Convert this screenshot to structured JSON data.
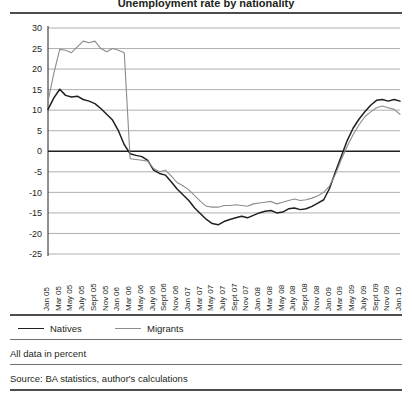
{
  "figure": {
    "title_partial": "Unemployment rate by nationality",
    "legend": [
      {
        "label": "Natives",
        "color": "#231f20",
        "style": "dark"
      },
      {
        "label": "Migrants",
        "color": "#8c8c8c",
        "style": "light"
      }
    ],
    "notes": {
      "units": "All data in percent",
      "source": "Source: BA statistics, author's calculations"
    }
  },
  "chart_data": {
    "type": "line",
    "title": "Unemployment rate by nationality",
    "xlabel": "",
    "ylabel": "",
    "ylim": [
      -25,
      30
    ],
    "ytick_step": 5,
    "yticks": [
      30,
      25,
      20,
      15,
      10,
      5,
      0,
      -5,
      -10,
      -15,
      -20,
      -25
    ],
    "ytick_labels": [
      "30",
      "25",
      "20",
      "15",
      "10",
      "5",
      "0",
      "-5",
      "-10",
      "-15",
      "-20",
      "-25"
    ],
    "grid": true,
    "zero_line": true,
    "legend_position": "below",
    "x_tick_labels": [
      "Jan 05",
      "Mar 05",
      "May 05",
      "July 05",
      "Sept 05",
      "Nov 05",
      "Jan 06",
      "Mar 06",
      "May 06",
      "July 06",
      "Sept 06",
      "Nov 06",
      "Jan 07",
      "Mar 07",
      "May 07",
      "July 07",
      "Sept 07",
      "Nov 07",
      "Jan 08",
      "Mar 08",
      "May 08",
      "July 08",
      "Sept 08",
      "Nov 08",
      "Jan 09",
      "Mar 09",
      "May 09",
      "July 09",
      "Sept 09",
      "Nov 09",
      "Jan 10"
    ],
    "x": [
      "Jan 05",
      "Feb 05",
      "Mar 05",
      "Apr 05",
      "May 05",
      "June 05",
      "July 05",
      "Aug 05",
      "Sept 05",
      "Oct 05",
      "Nov 05",
      "Dec 05",
      "Jan 06",
      "Feb 06",
      "Mar 06",
      "Apr 06",
      "May 06",
      "June 06",
      "July 06",
      "Aug 06",
      "Sept 06",
      "Oct 06",
      "Nov 06",
      "Dec 06",
      "Jan 07",
      "Feb 07",
      "Mar 07",
      "Apr 07",
      "May 07",
      "June 07",
      "July 07",
      "Aug 07",
      "Sept 07",
      "Oct 07",
      "Nov 07",
      "Dec 07",
      "Jan 08",
      "Feb 08",
      "Mar 08",
      "Apr 08",
      "May 08",
      "June 08",
      "July 08",
      "Aug 08",
      "Sept 08",
      "Oct 08",
      "Nov 08",
      "Dec 08",
      "Jan 09",
      "Feb 09",
      "Mar 09",
      "Apr 09",
      "May 09",
      "June 09",
      "July 09",
      "Aug 09",
      "Sept 09",
      "Oct 09",
      "Nov 09",
      "Dec 09",
      "Jan 10"
    ],
    "series": [
      {
        "name": "Natives",
        "color": "#231f20",
        "values": [
          10.2,
          13.0,
          15.1,
          13.6,
          13.2,
          13.4,
          12.6,
          12.2,
          11.6,
          10.4,
          9.0,
          7.6,
          5.0,
          1.6,
          -0.6,
          -1.0,
          -1.3,
          -2.2,
          -4.6,
          -5.4,
          -5.8,
          -7.4,
          -9.2,
          -10.6,
          -12.0,
          -13.8,
          -15.2,
          -16.6,
          -17.6,
          -17.9,
          -17.1,
          -16.6,
          -16.2,
          -15.8,
          -16.2,
          -15.6,
          -15.0,
          -14.6,
          -14.4,
          -15.0,
          -14.8,
          -14.0,
          -13.8,
          -14.2,
          -14.0,
          -13.4,
          -12.6,
          -11.8,
          -9.0,
          -5.0,
          -1.2,
          2.6,
          5.6,
          7.8,
          9.6,
          11.2,
          12.4,
          12.6,
          12.2,
          12.6,
          12.2
        ]
      },
      {
        "name": "Migrants",
        "color": "#8c8c8c",
        "values": [
          12.2,
          19.0,
          24.8,
          24.6,
          24.0,
          25.4,
          26.8,
          26.4,
          26.8,
          25.0,
          24.2,
          25.0,
          24.6,
          24.0,
          -1.8,
          -2.0,
          -2.2,
          -2.4,
          -4.2,
          -5.0,
          -4.6,
          -6.0,
          -7.6,
          -8.4,
          -9.4,
          -10.8,
          -12.2,
          -13.4,
          -13.6,
          -13.6,
          -13.2,
          -13.2,
          -13.0,
          -13.2,
          -13.4,
          -12.8,
          -12.6,
          -12.4,
          -12.2,
          -12.8,
          -12.4,
          -12.0,
          -11.6,
          -12.0,
          -11.8,
          -11.4,
          -10.8,
          -10.0,
          -8.4,
          -5.6,
          -2.0,
          1.2,
          4.0,
          6.4,
          8.4,
          9.6,
          10.6,
          11.0,
          10.6,
          10.2,
          9.0
        ]
      }
    ]
  }
}
